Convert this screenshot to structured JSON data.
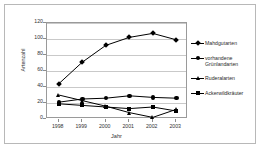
{
  "chart_data": {
    "type": "line",
    "title": "",
    "xlabel": "Jahr",
    "ylabel": "Artenzahl",
    "categories": [
      "1998",
      "1999",
      "2000",
      "2001",
      "2002",
      "2003"
    ],
    "ylim": [
      0,
      120
    ],
    "yticks": [
      0,
      20,
      40,
      60,
      80,
      100,
      120
    ],
    "grid": true,
    "legend_position": "right",
    "series": [
      {
        "name": "Mahdgutarten",
        "marker": "diamond",
        "color": "#000000",
        "values": [
          44,
          71,
          92,
          102,
          107,
          99
        ]
      },
      {
        "name": "vorhandene\nGrünlandarten",
        "marker": "circle",
        "color": "#000000",
        "values": [
          21,
          25,
          26,
          29,
          27,
          26
        ]
      },
      {
        "name": "Ruderalarten",
        "marker": "triangle",
        "color": "#000000",
        "values": [
          30,
          23,
          16,
          8,
          2,
          12
        ]
      },
      {
        "name": "Ackerwildkräuter",
        "marker": "square",
        "color": "#000000",
        "values": [
          19,
          17,
          15,
          13,
          15,
          10
        ]
      }
    ]
  },
  "axes": {
    "ytick_labels": [
      "0",
      "20",
      "40",
      "60",
      "80",
      "100",
      "120"
    ],
    "xtick_labels": [
      "1998",
      "1999",
      "2000",
      "2001",
      "2002",
      "2003"
    ],
    "y_title": "Artenzahl",
    "x_title": "Jahr"
  },
  "legend": {
    "entries": [
      {
        "label": "Mahdgutarten"
      },
      {
        "label": "vorhandene\nGrünlandarten"
      },
      {
        "label": "Ruderalarten"
      },
      {
        "label": "Ackerwildkräuter"
      }
    ]
  }
}
